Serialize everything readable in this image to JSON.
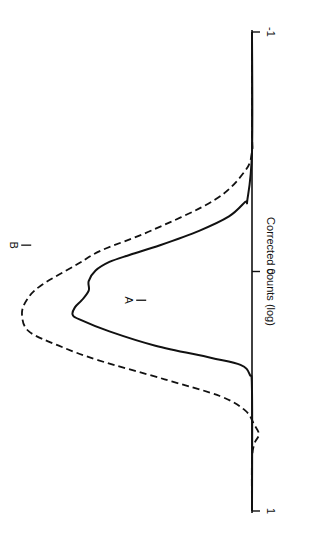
{
  "chart_data": {
    "type": "line",
    "orientation": "rotated-90-clockwise",
    "title": "",
    "xlabel": "Corrected counts (log)",
    "ylabel": "",
    "xlim": [
      -1,
      1
    ],
    "ylim": [
      0,
      1
    ],
    "xticks": [
      -1,
      0,
      1
    ],
    "xtick_labels": [
      "-1",
      "0",
      "1"
    ],
    "grid": false,
    "legend": "none",
    "series": [
      {
        "name": "A",
        "style": "solid",
        "x": [
          -1.0,
          -0.5,
          -0.3,
          -0.29,
          -0.23,
          -0.17,
          -0.11,
          -0.07,
          -0.04,
          -0.004,
          0.04,
          0.08,
          0.12,
          0.15,
          0.18,
          0.2,
          0.25,
          0.31,
          0.36,
          0.39,
          0.43,
          0.5,
          1.0
        ],
        "y": [
          0.0,
          0.0,
          0.02,
          0.03,
          0.1,
          0.23,
          0.4,
          0.53,
          0.62,
          0.68,
          0.71,
          0.71,
          0.74,
          0.77,
          0.78,
          0.75,
          0.62,
          0.42,
          0.18,
          0.05,
          0.01,
          0.0,
          0.0
        ]
      },
      {
        "name": "B",
        "style": "dashed",
        "x": [
          -1.0,
          -0.59,
          -0.5,
          -0.42,
          -0.3,
          -0.17,
          -0.09,
          -0.03,
          0.06,
          0.12,
          0.18,
          0.25,
          0.31,
          0.37,
          0.45,
          0.52,
          0.58,
          0.64,
          0.68,
          0.72,
          0.79,
          1.0
        ],
        "y": [
          0.0,
          0.0,
          0.0,
          0.03,
          0.16,
          0.44,
          0.65,
          0.76,
          0.92,
          0.98,
          1.0,
          0.97,
          0.84,
          0.67,
          0.38,
          0.14,
          0.03,
          -0.01,
          -0.03,
          -0.01,
          0.0,
          0.0
        ]
      }
    ],
    "annotations": [
      {
        "text": "A",
        "series": "A"
      },
      {
        "text": "B",
        "series": "B"
      }
    ]
  }
}
